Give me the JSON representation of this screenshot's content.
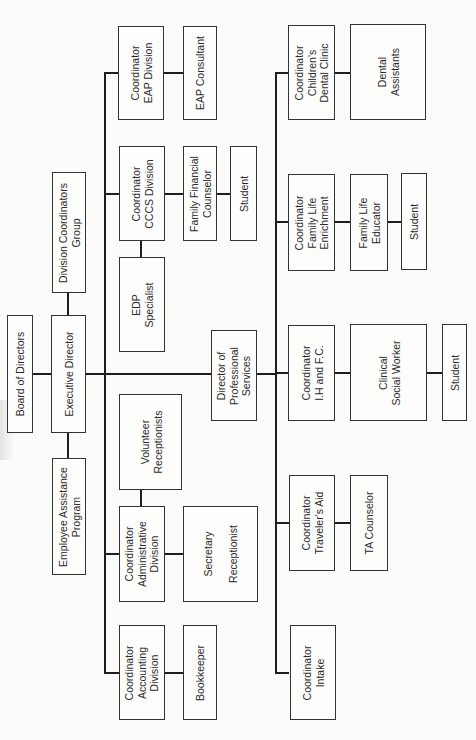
{
  "chart_title": "Organizational Chart (rotated 90°)",
  "colors": {
    "line": "#1e1e1e",
    "box_border": "#333333",
    "background": "#fbfbfa",
    "text": "#2b2b2b"
  },
  "top_level": {
    "board": "Board of Directors",
    "executive": "Executive Director",
    "division_group": "Division Coordinators\nGroup",
    "eap_program": "Employee Assistance\nProgram"
  },
  "left_branch": {
    "eap_division": {
      "coordinator": "Coordinator\nEAP Division",
      "staff": [
        "EAP Consultant"
      ]
    },
    "cccs_division": {
      "coordinator": "Coordinator\nCCCS Division",
      "staff": [
        "Family Financial\nCounselor",
        "Student"
      ],
      "support": "EDP\nSpecialist"
    },
    "director_ps": "Director of\nProfessional\nServices",
    "admin_division": {
      "coordinator": "Coordinator\nAdministrative\nDivision",
      "staff": [
        "Secretary\n\nReceptionist"
      ],
      "support": "Volunteer\nReceptionists"
    },
    "accounting_division": {
      "coordinator": "Coordinator\nAccounting\nDivision",
      "staff": [
        "Bookkeeper"
      ]
    }
  },
  "right_branch": {
    "dental": {
      "coordinator": "Coordinator\nChildren's\nDental Clinic",
      "staff": [
        "Dental\nAssistants"
      ]
    },
    "family_life": {
      "coordinator": "Coordinator\nFamily Life\nEnrichment",
      "staff": [
        "Family Life\nEducator",
        "Student"
      ]
    },
    "ih_fc": {
      "coordinator": "Coordinator\nI.H and F.C.",
      "staff": [
        "Clinical\nSocial Worker",
        "Student"
      ]
    },
    "travelers_aid": {
      "coordinator": "Coordinator\nTraveler's Aid",
      "staff": [
        "TA Counselor"
      ]
    },
    "intake": {
      "coordinator": "Coordinator\nIntake"
    }
  }
}
